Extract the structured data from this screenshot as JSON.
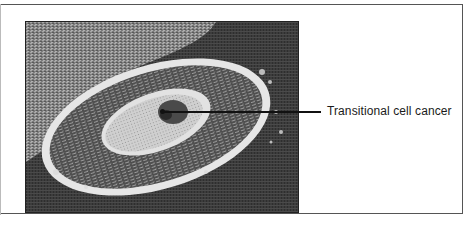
{
  "figure": {
    "annotation": {
      "label": "Transitional cell cancer"
    },
    "photo": {
      "description": "grayscale photomicrograph of elliptical tumor",
      "colors": {
        "background": "#3a3a3a",
        "tissue_texture": "#8a8a8a",
        "ring": "#e8e8e8",
        "inner_dark": "#4a4a4a",
        "core_light": "#d8d8d8",
        "center_spot": "#2a2a2a"
      }
    }
  }
}
